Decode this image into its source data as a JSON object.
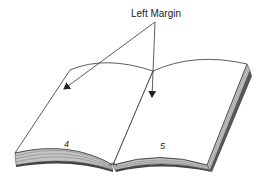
{
  "diagram": {
    "callout_label": "Left Margin",
    "pages": [
      {
        "side": "left",
        "number": "4"
      },
      {
        "side": "right",
        "number": "5"
      }
    ],
    "colors": {
      "line": "#333333",
      "page": "#ffffff",
      "page_edge_fill": "#bdbdbd",
      "cover_edge": "#444444"
    }
  }
}
